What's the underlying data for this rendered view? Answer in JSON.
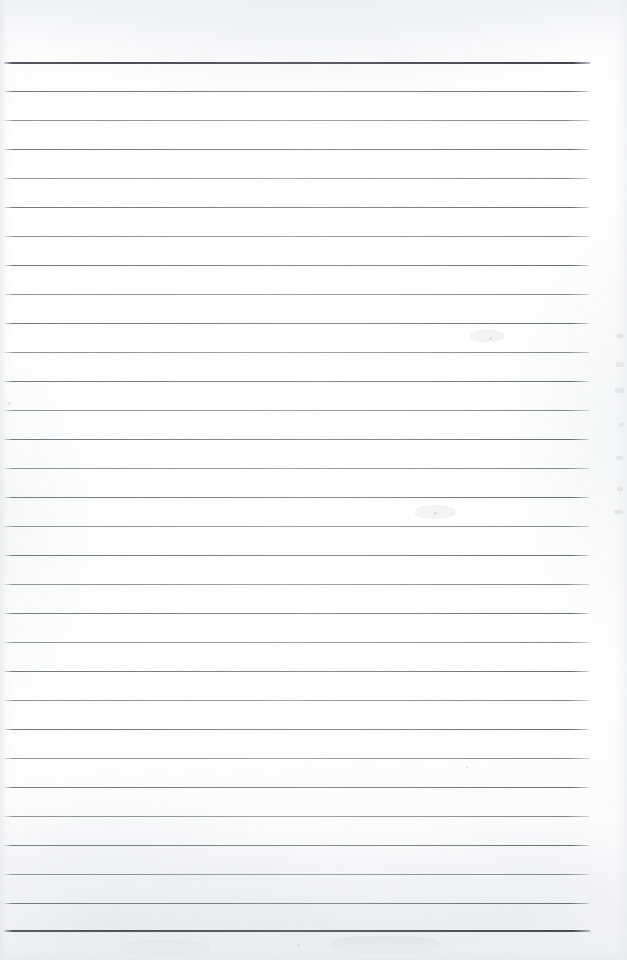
{
  "document": {
    "kind": "scanned-blank-lined-page",
    "title": "Blank Ruled Notebook Page",
    "caption": "",
    "page_width": 627,
    "page_height": 960,
    "written_text": "",
    "colors": {
      "paper": "#fdfdfd",
      "rule_light": "#8e9098",
      "rule_medium": "#787a84",
      "rule_heavy": "#4a4c56",
      "edge_shadow": "#e4e5ea"
    },
    "geometry": {
      "rule_left_x": 4,
      "rule_right_x": 590,
      "first_rule_y": 62,
      "last_rule_y": 930,
      "rule_spacing": 29,
      "top_margin_height": 62,
      "bottom_margin_height": 30
    }
  },
  "rules": [
    {
      "id": "rule-01",
      "y": 62,
      "left": 4,
      "width": 586,
      "weight": "heavy"
    },
    {
      "id": "rule-02",
      "y": 91,
      "left": 4,
      "width": 585,
      "weight": "medium"
    },
    {
      "id": "rule-03",
      "y": 120,
      "left": 4,
      "width": 585,
      "weight": "light"
    },
    {
      "id": "rule-04",
      "y": 149,
      "left": 4,
      "width": 585,
      "weight": "medium"
    },
    {
      "id": "rule-05",
      "y": 178,
      "left": 4,
      "width": 585,
      "weight": "light"
    },
    {
      "id": "rule-06",
      "y": 207,
      "left": 4,
      "width": 585,
      "weight": "medium"
    },
    {
      "id": "rule-07",
      "y": 236,
      "left": 4,
      "width": 585,
      "weight": "light"
    },
    {
      "id": "rule-08",
      "y": 265,
      "left": 4,
      "width": 585,
      "weight": "medium"
    },
    {
      "id": "rule-09",
      "y": 294,
      "left": 4,
      "width": 585,
      "weight": "light"
    },
    {
      "id": "rule-10",
      "y": 323,
      "left": 4,
      "width": 585,
      "weight": "medium"
    },
    {
      "id": "rule-11",
      "y": 352,
      "left": 4,
      "width": 585,
      "weight": "light"
    },
    {
      "id": "rule-12",
      "y": 381,
      "left": 4,
      "width": 585,
      "weight": "medium"
    },
    {
      "id": "rule-13",
      "y": 410,
      "left": 4,
      "width": 585,
      "weight": "light"
    },
    {
      "id": "rule-14",
      "y": 439,
      "left": 4,
      "width": 585,
      "weight": "medium"
    },
    {
      "id": "rule-15",
      "y": 468,
      "left": 4,
      "width": 585,
      "weight": "light"
    },
    {
      "id": "rule-16",
      "y": 497,
      "left": 4,
      "width": 585,
      "weight": "medium"
    },
    {
      "id": "rule-17",
      "y": 526,
      "left": 4,
      "width": 585,
      "weight": "light"
    },
    {
      "id": "rule-18",
      "y": 555,
      "left": 4,
      "width": 585,
      "weight": "medium"
    },
    {
      "id": "rule-19",
      "y": 584,
      "left": 4,
      "width": 585,
      "weight": "light"
    },
    {
      "id": "rule-20",
      "y": 613,
      "left": 4,
      "width": 585,
      "weight": "medium"
    },
    {
      "id": "rule-21",
      "y": 642,
      "left": 4,
      "width": 585,
      "weight": "light"
    },
    {
      "id": "rule-22",
      "y": 671,
      "left": 4,
      "width": 585,
      "weight": "medium"
    },
    {
      "id": "rule-23",
      "y": 700,
      "left": 4,
      "width": 585,
      "weight": "light"
    },
    {
      "id": "rule-24",
      "y": 729,
      "left": 4,
      "width": 585,
      "weight": "medium"
    },
    {
      "id": "rule-25",
      "y": 758,
      "left": 4,
      "width": 585,
      "weight": "light"
    },
    {
      "id": "rule-26",
      "y": 787,
      "left": 4,
      "width": 585,
      "weight": "medium"
    },
    {
      "id": "rule-27",
      "y": 816,
      "left": 4,
      "width": 585,
      "weight": "light"
    },
    {
      "id": "rule-28",
      "y": 845,
      "left": 4,
      "width": 585,
      "weight": "medium"
    },
    {
      "id": "rule-29",
      "y": 874,
      "left": 4,
      "width": 585,
      "weight": "light"
    },
    {
      "id": "rule-30",
      "y": 903,
      "left": 4,
      "width": 585,
      "weight": "medium"
    },
    {
      "id": "rule-31",
      "y": 930,
      "left": 4,
      "width": 586,
      "weight": "heavy"
    }
  ],
  "margin_marks": [
    {
      "id": "mark-01",
      "x": 617,
      "y": 334,
      "width": 7,
      "height": 4
    },
    {
      "id": "mark-02",
      "x": 616,
      "y": 362,
      "width": 8,
      "height": 5
    },
    {
      "id": "mark-03",
      "x": 615,
      "y": 388,
      "width": 9,
      "height": 5
    },
    {
      "id": "mark-04",
      "x": 619,
      "y": 423,
      "width": 5,
      "height": 3
    },
    {
      "id": "mark-05",
      "x": 616,
      "y": 456,
      "width": 7,
      "height": 4
    },
    {
      "id": "mark-06",
      "x": 617,
      "y": 487,
      "width": 6,
      "height": 4
    },
    {
      "id": "mark-07",
      "x": 614,
      "y": 510,
      "width": 9,
      "height": 4
    }
  ],
  "specks": [
    {
      "id": "speck-01",
      "x": 8,
      "y": 402,
      "size": 3
    },
    {
      "id": "speck-02",
      "x": 489,
      "y": 337,
      "size": 3
    },
    {
      "id": "speck-03",
      "x": 434,
      "y": 512,
      "size": 3
    },
    {
      "id": "speck-04",
      "x": 466,
      "y": 766,
      "size": 2
    },
    {
      "id": "speck-05",
      "x": 297,
      "y": 944,
      "size": 3
    }
  ],
  "ghosts": [
    {
      "id": "ghost-01",
      "x": 470,
      "y": 330,
      "width": 34,
      "height": 12
    },
    {
      "id": "ghost-02",
      "x": 415,
      "y": 505,
      "width": 40,
      "height": 14
    },
    {
      "id": "ghost-03",
      "x": 120,
      "y": 940,
      "width": 90,
      "height": 16
    },
    {
      "id": "ghost-04",
      "x": 330,
      "y": 936,
      "width": 110,
      "height": 18
    }
  ]
}
